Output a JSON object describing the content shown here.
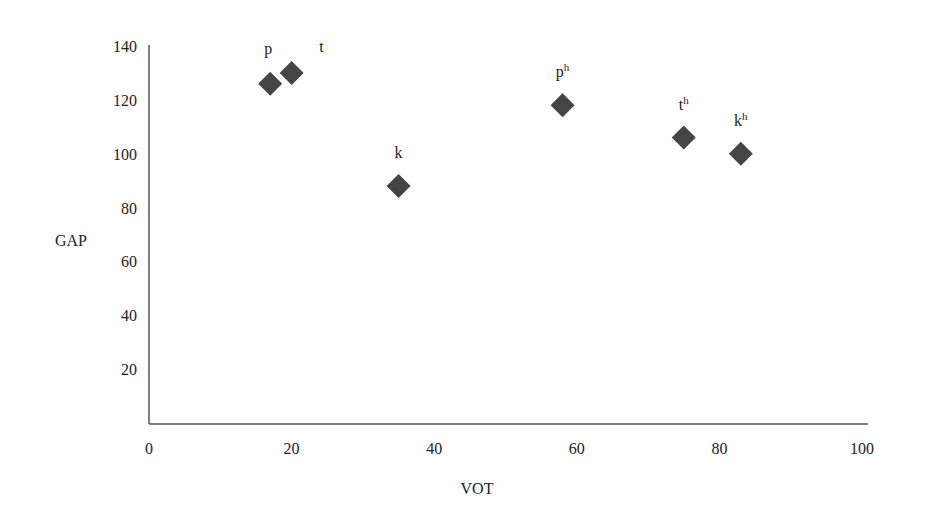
{
  "chart_data": {
    "type": "scatter",
    "title": "",
    "xlabel": "VOT",
    "ylabel": "GAP",
    "xlim": [
      0,
      100
    ],
    "ylim": [
      0,
      140
    ],
    "xticks": [
      0,
      20,
      40,
      60,
      80,
      100
    ],
    "yticks": [
      20,
      40,
      60,
      80,
      100,
      120,
      140
    ],
    "grid": false,
    "legend": null,
    "marker": "diamond",
    "marker_color": "#454545",
    "axis_color": "#555555",
    "points": [
      {
        "label": "p",
        "base": "p",
        "sup": "",
        "x": 17,
        "y": 126
      },
      {
        "label": "t",
        "base": "t",
        "sup": "",
        "x": 20,
        "y": 130
      },
      {
        "label": "k",
        "base": "k",
        "sup": "",
        "x": 35,
        "y": 88
      },
      {
        "label": "pʰ",
        "base": "p",
        "sup": "h",
        "x": 58,
        "y": 118
      },
      {
        "label": "tʰ",
        "base": "t",
        "sup": "h",
        "x": 75,
        "y": 106
      },
      {
        "label": "kʰ",
        "base": "k",
        "sup": "h",
        "x": 83,
        "y": 100
      }
    ]
  }
}
